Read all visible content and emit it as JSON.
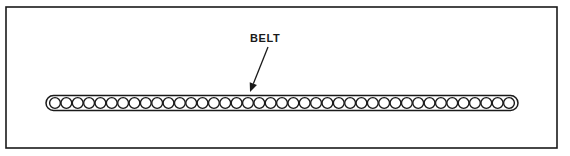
{
  "figure": {
    "background_color": "#ffffff",
    "line_color": "#1a1a1a",
    "frame": {
      "x": 6,
      "y": 7,
      "width": 551,
      "height": 141,
      "visible": true
    }
  },
  "callouts": [
    {
      "id": "belt",
      "label": "BELT",
      "text_x": 250,
      "text_y": 42,
      "leader_from_x": 268,
      "leader_from_y": 47,
      "leader_to_x": 250,
      "leader_to_y": 92,
      "arrowhead": "down-left"
    }
  ],
  "belt": {
    "name": "BELT",
    "left_x": 46,
    "right_x": 518,
    "center_y": 103,
    "band_height": 15,
    "link_count": 41,
    "link_radius": 5.4,
    "link_spacing": 11.35,
    "first_link_center_x": 55,
    "end_cap": "rounded"
  }
}
